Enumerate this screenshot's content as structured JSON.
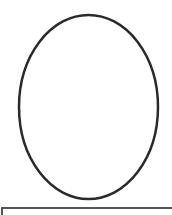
{
  "canvas": {
    "width": 172,
    "height": 215,
    "background": "#ffffff"
  },
  "shape": {
    "type": "ellipse",
    "cx": 88.5,
    "cy": 107,
    "rx": 69.5,
    "ry": 92,
    "stroke": "#2a2a2a",
    "stroke_width": 2.5,
    "fill": "none"
  },
  "bottom_panel": {
    "border_color": "#555555"
  }
}
